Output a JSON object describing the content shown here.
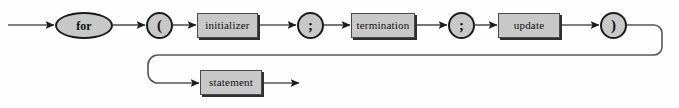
{
  "diagram": {
    "kind": "railroad-syntax-diagram",
    "canvas": {
      "width": 679,
      "height": 108
    },
    "colors": {
      "background": "#fefefe",
      "node_fill": "#c8c8c8",
      "node_border": "#1c1c1c",
      "box_border": "#4a4a4a",
      "box_shadow": "#2e2e2e",
      "rail": "#555555",
      "text": "#111111"
    },
    "nodes": [
      {
        "id": "for",
        "label": "for",
        "shape": "ellipse",
        "kind": "terminal",
        "x": 55,
        "y": 12,
        "w": 58,
        "h": 27
      },
      {
        "id": "lparen",
        "label": "(",
        "shape": "circle",
        "kind": "terminal",
        "x": 146,
        "y": 12,
        "w": 27,
        "h": 27
      },
      {
        "id": "initializer",
        "label": "initializer",
        "shape": "box",
        "kind": "nonterminal",
        "x": 197,
        "y": 13,
        "w": 61,
        "h": 25
      },
      {
        "id": "semi1",
        "label": ";",
        "shape": "circle",
        "kind": "terminal",
        "x": 297,
        "y": 12,
        "w": 27,
        "h": 27
      },
      {
        "id": "termination",
        "label": "termination",
        "shape": "box",
        "kind": "nonterminal",
        "x": 351,
        "y": 13,
        "w": 64,
        "h": 25
      },
      {
        "id": "semi2",
        "label": ";",
        "shape": "circle",
        "kind": "terminal",
        "x": 448,
        "y": 12,
        "w": 27,
        "h": 27
      },
      {
        "id": "update",
        "label": "update",
        "shape": "box",
        "kind": "nonterminal",
        "x": 498,
        "y": 13,
        "w": 62,
        "h": 25
      },
      {
        "id": "rparen",
        "label": ")",
        "shape": "circle",
        "kind": "terminal",
        "x": 600,
        "y": 12,
        "w": 27,
        "h": 27
      },
      {
        "id": "statement",
        "label": "statement",
        "shape": "box",
        "kind": "nonterminal",
        "x": 200,
        "y": 70,
        "w": 62,
        "h": 25
      }
    ],
    "rails": {
      "entry_x": 8,
      "top_row_y": 25,
      "bottom_row_y": 83,
      "return_y": 55,
      "right_turn_x": 662,
      "left_turn_x": 150,
      "exit_x": 300
    },
    "sequence": [
      "for",
      "(",
      "initializer",
      ";",
      "termination",
      ";",
      "update",
      ")",
      "statement"
    ]
  }
}
